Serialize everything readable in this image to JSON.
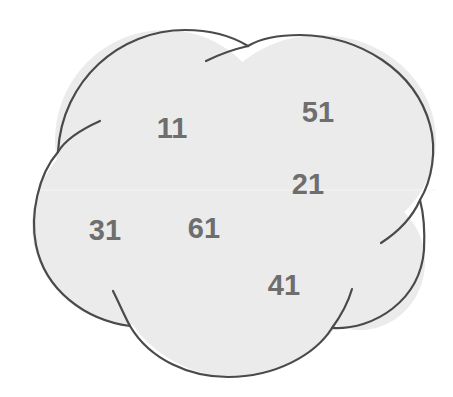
{
  "diagram": {
    "type": "overlapping-ellipses",
    "colors": {
      "fill": "#ebebeb",
      "outline": "#4a4a4a",
      "label": "#6e6e6e",
      "background": "#ffffff"
    },
    "labels": [
      {
        "id": "label-11",
        "text": "11",
        "x": 172,
        "y": 138
      },
      {
        "id": "label-51",
        "text": "51",
        "x": 318,
        "y": 122
      },
      {
        "id": "label-21",
        "text": "21",
        "x": 308,
        "y": 194
      },
      {
        "id": "label-31",
        "text": "31",
        "x": 105,
        "y": 240
      },
      {
        "id": "label-61",
        "text": "61",
        "x": 204,
        "y": 238
      },
      {
        "id": "label-41",
        "text": "41",
        "x": 284,
        "y": 295
      }
    ]
  }
}
